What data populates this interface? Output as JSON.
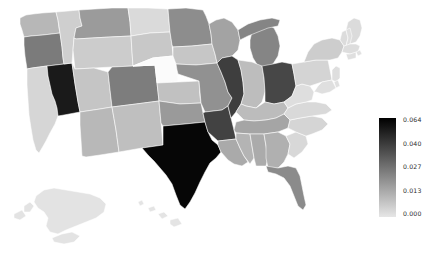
{
  "figure": {
    "kind": "choropleth-map",
    "background": "#ffffff",
    "region": "United States",
    "title": ""
  },
  "colorbar": {
    "name": "value-colorbar",
    "orientation": "vertical",
    "colormap": "greys-reversed",
    "high_color": "#000000",
    "low_color": "#e6e6e6",
    "ticks": [
      "0.064",
      "0.040",
      "0.027",
      "0.013",
      "0.000"
    ],
    "tick_values": [
      0.064,
      0.04,
      0.027,
      0.013,
      0.0
    ],
    "vmin": "0.000",
    "vmax": "0.064"
  },
  "chart_data": {
    "type": "heatmap",
    "subtype": "choropleth",
    "title": "",
    "xlabel": "",
    "ylabel": "",
    "colorbar_label": "",
    "cmin": 0.0,
    "cmax": 0.064,
    "colorscale": "Greys (dark = high)",
    "legend_position": "right",
    "grid": false,
    "locationmode": "USA-states",
    "categories": [
      "Texas",
      "Nevada",
      "Illinois",
      "Arkansas",
      "Ohio",
      "Oregon",
      "Colorado",
      "Michigan",
      "Florida",
      "Missouri",
      "Oklahoma",
      "Tennessee",
      "Louisiana",
      "Alabama",
      "Georgia",
      "Mississippi",
      "Kentucky",
      "Indiana",
      "Wisconsin",
      "Minnesota",
      "Iowa",
      "Kansas",
      "Arizona",
      "New Mexico",
      "Utah",
      "Washington",
      "Idaho",
      "Montana",
      "Wyoming",
      "North Dakota",
      "South Dakota",
      "Nebraska",
      "California",
      "Virginia",
      "North Carolina",
      "South Carolina",
      "West Virginia",
      "Pennsylvania",
      "New York",
      "Maine",
      "Vermont",
      "New Hampshire",
      "Massachusetts",
      "Rhode Island",
      "Connecticut",
      "New Jersey",
      "Delaware",
      "Maryland",
      "Alaska",
      "Hawaii"
    ],
    "values": [
      0.064,
      0.06,
      0.044,
      0.043,
      0.041,
      0.03,
      0.03,
      0.029,
      0.028,
      0.026,
      0.024,
      0.022,
      0.021,
      0.02,
      0.019,
      0.018,
      0.016,
      0.015,
      0.022,
      0.028,
      0.013,
      0.014,
      0.017,
      0.015,
      0.013,
      0.017,
      0.011,
      0.024,
      0.012,
      0.009,
      0.013,
      0.002,
      0.01,
      0.009,
      0.01,
      0.009,
      0.008,
      0.01,
      0.012,
      0.009,
      0.009,
      0.008,
      0.008,
      0.007,
      0.008,
      0.008,
      0.007,
      0.008,
      0.009,
      0.008
    ]
  },
  "states": [
    {
      "code": "TX",
      "name": "Texas",
      "value": 0.064,
      "fill": "#060606"
    },
    {
      "code": "NV",
      "name": "Nevada",
      "value": 0.06,
      "fill": "#1a1a1a"
    },
    {
      "code": "IL",
      "name": "Illinois",
      "value": 0.044,
      "fill": "#3e3e3e"
    },
    {
      "code": "AR",
      "name": "Arkansas",
      "value": 0.043,
      "fill": "#424242"
    },
    {
      "code": "OH",
      "name": "Ohio",
      "value": 0.041,
      "fill": "#474747"
    },
    {
      "code": "OR",
      "name": "Oregon",
      "value": 0.03,
      "fill": "#7b7b7b"
    },
    {
      "code": "CO",
      "name": "Colorado",
      "value": 0.03,
      "fill": "#7d7d7d"
    },
    {
      "code": "MI",
      "name": "Michigan",
      "value": 0.029,
      "fill": "#858585"
    },
    {
      "code": "FL",
      "name": "Florida",
      "value": 0.028,
      "fill": "#8b8b8b"
    },
    {
      "code": "MO",
      "name": "Missouri",
      "value": 0.026,
      "fill": "#919191"
    },
    {
      "code": "OK",
      "name": "Oklahoma",
      "value": 0.024,
      "fill": "#9a9a9a"
    },
    {
      "code": "TN",
      "name": "Tennessee",
      "value": 0.022,
      "fill": "#a5a5a5"
    },
    {
      "code": "LA",
      "name": "Louisiana",
      "value": 0.021,
      "fill": "#aaaaaa"
    },
    {
      "code": "AL",
      "name": "Alabama",
      "value": 0.02,
      "fill": "#ababab"
    },
    {
      "code": "GA",
      "name": "Georgia",
      "value": 0.019,
      "fill": "#b0b0b0"
    },
    {
      "code": "MS",
      "name": "Mississippi",
      "value": 0.018,
      "fill": "#b4b4b4"
    },
    {
      "code": "KY",
      "name": "Kentucky",
      "value": 0.016,
      "fill": "#bcbcbc"
    },
    {
      "code": "IN",
      "name": "Indiana",
      "value": 0.015,
      "fill": "#bdbdbd"
    },
    {
      "code": "WI",
      "name": "Wisconsin",
      "value": 0.022,
      "fill": "#a3a3a3"
    },
    {
      "code": "MN",
      "name": "Minnesota",
      "value": 0.028,
      "fill": "#8d8d8d"
    },
    {
      "code": "IA",
      "name": "Iowa",
      "value": 0.013,
      "fill": "#c6c6c6"
    },
    {
      "code": "KS",
      "name": "Kansas",
      "value": 0.014,
      "fill": "#c1c1c1"
    },
    {
      "code": "AZ",
      "name": "Arizona",
      "value": 0.017,
      "fill": "#b8b8b8"
    },
    {
      "code": "NM",
      "name": "New Mexico",
      "value": 0.015,
      "fill": "#bfbfbf"
    },
    {
      "code": "UT",
      "name": "Utah",
      "value": 0.013,
      "fill": "#c5c5c5"
    },
    {
      "code": "WA",
      "name": "Washington",
      "value": 0.017,
      "fill": "#b7b7b7"
    },
    {
      "code": "ID",
      "name": "Idaho",
      "value": 0.011,
      "fill": "#cfcfcf"
    },
    {
      "code": "MT",
      "name": "Montana",
      "value": 0.024,
      "fill": "#9b9b9b"
    },
    {
      "code": "WY",
      "name": "Wyoming",
      "value": 0.012,
      "fill": "#cccccc"
    },
    {
      "code": "ND",
      "name": "North Dakota",
      "value": 0.009,
      "fill": "#dadada"
    },
    {
      "code": "SD",
      "name": "South Dakota",
      "value": 0.013,
      "fill": "#c8c8c8"
    },
    {
      "code": "NE",
      "name": "Nebraska",
      "value": 0.002,
      "fill": "#fbfbfb"
    },
    {
      "code": "CA",
      "name": "California",
      "value": 0.01,
      "fill": "#d6d6d6"
    },
    {
      "code": "VA",
      "name": "Virginia",
      "value": 0.009,
      "fill": "#d9d9d9"
    },
    {
      "code": "NC",
      "name": "North Carolina",
      "value": 0.01,
      "fill": "#d5d5d5"
    },
    {
      "code": "SC",
      "name": "South Carolina",
      "value": 0.009,
      "fill": "#d8d8d8"
    },
    {
      "code": "WV",
      "name": "West Virginia",
      "value": 0.008,
      "fill": "#dedede"
    },
    {
      "code": "PA",
      "name": "Pennsylvania",
      "value": 0.01,
      "fill": "#d4d4d4"
    },
    {
      "code": "NY",
      "name": "New York",
      "value": 0.012,
      "fill": "#cdcdcd"
    },
    {
      "code": "ME",
      "name": "Maine",
      "value": 0.009,
      "fill": "#dbdbdb"
    },
    {
      "code": "VT",
      "name": "Vermont",
      "value": 0.009,
      "fill": "#dcdcdc"
    },
    {
      "code": "NH",
      "name": "New Hampshire",
      "value": 0.008,
      "fill": "#dedede"
    },
    {
      "code": "MA",
      "name": "Massachusetts",
      "value": 0.008,
      "fill": "#dddddd"
    },
    {
      "code": "RI",
      "name": "Rhode Island",
      "value": 0.007,
      "fill": "#e1e1e1"
    },
    {
      "code": "CT",
      "name": "Connecticut",
      "value": 0.008,
      "fill": "#dfdfdf"
    },
    {
      "code": "NJ",
      "name": "New Jersey",
      "value": 0.008,
      "fill": "#dededE"
    },
    {
      "code": "DE",
      "name": "Delaware",
      "value": 0.007,
      "fill": "#e0e0e0"
    },
    {
      "code": "MD",
      "name": "Maryland",
      "value": 0.008,
      "fill": "#dfdfdf"
    },
    {
      "code": "AK",
      "name": "Alaska",
      "value": 0.009,
      "fill": "#e3e3e3"
    },
    {
      "code": "HI",
      "name": "Hawaii",
      "value": 0.008,
      "fill": "#e4e4e4"
    }
  ]
}
